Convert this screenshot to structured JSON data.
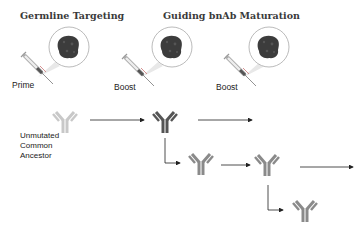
{
  "titles": {
    "germline": "Germline Targeting",
    "maturation": "Guiding bnAb Maturation"
  },
  "immunizations": [
    {
      "label": "Prime",
      "icon": "syringe-icon",
      "immunogen": "protein-immunogen-icon"
    },
    {
      "label": "Boost",
      "icon": "syringe-icon",
      "immunogen": "protein-immunogen-icon"
    },
    {
      "label": "Boost",
      "icon": "syringe-icon",
      "immunogen": "protein-immunogen-icon"
    }
  ],
  "ancestor": {
    "label_line1": "Unmutated",
    "label_line2": "Common",
    "label_line3": "Ancestor"
  },
  "antibodies": [
    {
      "id": "uca",
      "shade": "light",
      "color": "#c8c8c8"
    },
    {
      "id": "boost1",
      "shade": "dark",
      "color": "#555555"
    },
    {
      "id": "branch1",
      "shade": "medium",
      "color": "#8a8a8a"
    },
    {
      "id": "boost2",
      "shade": "medium",
      "color": "#8a8a8a"
    },
    {
      "id": "branch2",
      "shade": "medium",
      "color": "#8a8a8a"
    }
  ],
  "colors": {
    "arrow": "#222222",
    "immunogen": "#3c3c3c",
    "circle_stroke": "#bbbbbb"
  }
}
